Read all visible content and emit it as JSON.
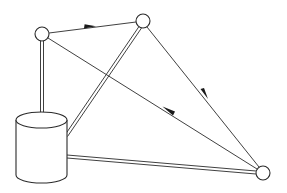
{
  "diagram": {
    "type": "network-topology",
    "colors": {
      "stroke": "#2a2a2a",
      "fill": "#ffffff",
      "background": "#ffffff"
    },
    "nodes": [
      {
        "id": "node-left",
        "shape": "circle",
        "cx": 42,
        "cy": 34,
        "r": 7,
        "label": ""
      },
      {
        "id": "node-top",
        "shape": "circle",
        "cx": 143,
        "cy": 21,
        "r": 7,
        "label": ""
      },
      {
        "id": "node-bottom-right",
        "shape": "circle",
        "cx": 263,
        "cy": 173,
        "r": 7,
        "label": ""
      },
      {
        "id": "database",
        "shape": "cylinder",
        "x": 16,
        "y": 112,
        "width": 51,
        "height": 72,
        "label": ""
      }
    ],
    "edges": [
      {
        "from": "node-left",
        "to": "node-top",
        "style": "single",
        "arrow": "forward",
        "arrow_at": [
          90,
          27
        ]
      },
      {
        "from": "node-top",
        "to": "node-bottom-right",
        "style": "single",
        "arrow": "forward",
        "arrow_at": [
          205,
          95
        ]
      },
      {
        "from": "node-bottom-right",
        "to": "node-left",
        "style": "single",
        "arrow": "forward",
        "arrow_at": [
          168,
          110
        ]
      },
      {
        "from": "node-left",
        "to": "database",
        "style": "double",
        "arrow": "none"
      },
      {
        "from": "node-top",
        "to": "database",
        "style": "double",
        "arrow": "none"
      },
      {
        "from": "database",
        "to": "node-bottom-right",
        "style": "double",
        "arrow": "none"
      }
    ],
    "description": "Three circular nodes and a database cylinder; directed single-line links form a cycle among circles, double-line links connect each circle to the database."
  }
}
